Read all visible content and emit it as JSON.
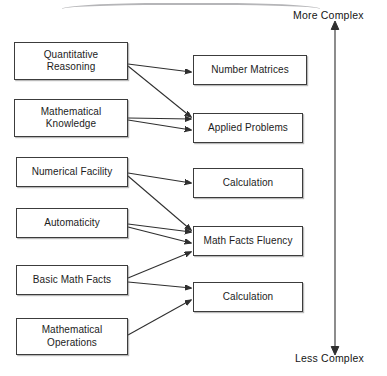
{
  "diagram": {
    "background_color": "#ffffff",
    "line_color": "#2f2f2f",
    "box_border_color": "#3c3c3c",
    "axis": {
      "name": "complexity-axis",
      "top_label": "More Complex",
      "bottom_label": "Less Complex",
      "direction": "bidirectional-vertical"
    },
    "left_nodes": [
      {
        "id": "quantitative-reasoning",
        "label": "Quantitative\nReasoning",
        "x": 14,
        "y": 42,
        "w": 114,
        "h": 38
      },
      {
        "id": "mathematical-knowledge",
        "label": "Mathematical\nKnowledge",
        "x": 14,
        "y": 99,
        "w": 114,
        "h": 38
      },
      {
        "id": "numerical-facility",
        "label": "Numerical Facility",
        "x": 16,
        "y": 157,
        "w": 112,
        "h": 30
      },
      {
        "id": "automaticity",
        "label": "Automaticity",
        "x": 16,
        "y": 208,
        "w": 112,
        "h": 30
      },
      {
        "id": "basic-math-facts",
        "label": "Basic Math Facts",
        "x": 16,
        "y": 265,
        "w": 112,
        "h": 30
      },
      {
        "id": "mathematical-operations",
        "label": "Mathematical\nOperations",
        "x": 16,
        "y": 318,
        "w": 112,
        "h": 37
      }
    ],
    "right_nodes": [
      {
        "id": "number-matrices",
        "label": "Number Matrices",
        "x": 193,
        "y": 55,
        "w": 114,
        "h": 30
      },
      {
        "id": "applied-problems",
        "label": "Applied Problems",
        "x": 193,
        "y": 113,
        "w": 110,
        "h": 30
      },
      {
        "id": "calculation-upper",
        "label": "Calculation",
        "x": 193,
        "y": 168,
        "w": 110,
        "h": 30
      },
      {
        "id": "math-facts-fluency",
        "label": "Math Facts Fluency",
        "x": 193,
        "y": 226,
        "w": 110,
        "h": 30
      },
      {
        "id": "calculation-lower",
        "label": "Calculation",
        "x": 193,
        "y": 282,
        "w": 110,
        "h": 30
      }
    ],
    "edges": [
      {
        "from": "quantitative-reasoning",
        "to": "number-matrices",
        "x1": 128,
        "y1": 64,
        "x2": 191,
        "y2": 72
      },
      {
        "from": "quantitative-reasoning",
        "to": "applied-problems",
        "x1": 128,
        "y1": 66,
        "x2": 191,
        "y2": 117
      },
      {
        "from": "mathematical-knowledge",
        "to": "applied-problems",
        "x1": 128,
        "y1": 118,
        "x2": 191,
        "y2": 119
      },
      {
        "from": "mathematical-knowledge",
        "to": "applied-problems",
        "x1": 128,
        "y1": 120,
        "x2": 191,
        "y2": 130
      },
      {
        "from": "numerical-facility",
        "to": "calculation-upper",
        "x1": 128,
        "y1": 173,
        "x2": 191,
        "y2": 183
      },
      {
        "from": "numerical-facility",
        "to": "math-facts-fluency",
        "x1": 128,
        "y1": 176,
        "x2": 191,
        "y2": 230
      },
      {
        "from": "automaticity",
        "to": "math-facts-fluency",
        "x1": 128,
        "y1": 224,
        "x2": 191,
        "y2": 232
      },
      {
        "from": "automaticity",
        "to": "math-facts-fluency",
        "x1": 128,
        "y1": 227,
        "x2": 191,
        "y2": 243
      },
      {
        "from": "basic-math-facts",
        "to": "math-facts-fluency",
        "x1": 128,
        "y1": 278,
        "x2": 191,
        "y2": 252
      },
      {
        "from": "basic-math-facts",
        "to": "calculation-lower",
        "x1": 128,
        "y1": 282,
        "x2": 191,
        "y2": 288
      },
      {
        "from": "mathematical-operations",
        "to": "calculation-lower",
        "x1": 128,
        "y1": 335,
        "x2": 191,
        "y2": 300
      }
    ],
    "axis_geometry": {
      "x": 335,
      "top_y": 29,
      "bottom_y": 347
    }
  }
}
